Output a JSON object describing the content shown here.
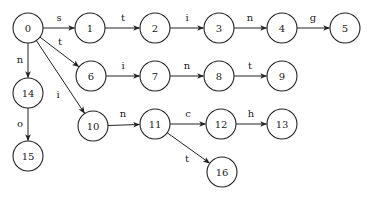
{
  "diagram": {
    "type": "trie",
    "node_radius": 15,
    "nodes": [
      {
        "id": "0",
        "x": 28,
        "y": 28
      },
      {
        "id": "1",
        "x": 90,
        "y": 28
      },
      {
        "id": "2",
        "x": 155,
        "y": 28
      },
      {
        "id": "3",
        "x": 219,
        "y": 28
      },
      {
        "id": "4",
        "x": 282,
        "y": 28
      },
      {
        "id": "5",
        "x": 345,
        "y": 28
      },
      {
        "id": "6",
        "x": 91,
        "y": 76
      },
      {
        "id": "7",
        "x": 155,
        "y": 76
      },
      {
        "id": "8",
        "x": 219,
        "y": 76
      },
      {
        "id": "9",
        "x": 282,
        "y": 76
      },
      {
        "id": "14",
        "x": 28,
        "y": 93
      },
      {
        "id": "15",
        "x": 28,
        "y": 156
      },
      {
        "id": "10",
        "x": 93,
        "y": 126
      },
      {
        "id": "11",
        "x": 155,
        "y": 124
      },
      {
        "id": "12",
        "x": 221,
        "y": 124
      },
      {
        "id": "13",
        "x": 282,
        "y": 124
      },
      {
        "id": "16",
        "x": 222,
        "y": 172
      }
    ],
    "edges": [
      {
        "from": "0",
        "to": "1",
        "label": "s",
        "lx": 59,
        "ly": 21
      },
      {
        "from": "1",
        "to": "2",
        "label": "t",
        "lx": 123,
        "ly": 21
      },
      {
        "from": "2",
        "to": "3",
        "label": "i",
        "lx": 187,
        "ly": 21
      },
      {
        "from": "3",
        "to": "4",
        "label": "n",
        "lx": 250,
        "ly": 21
      },
      {
        "from": "4",
        "to": "5",
        "label": "g",
        "lx": 313,
        "ly": 21
      },
      {
        "from": "0",
        "to": "6",
        "label": "t",
        "lx": 60,
        "ly": 45
      },
      {
        "from": "6",
        "to": "7",
        "label": "i",
        "lx": 123,
        "ly": 69
      },
      {
        "from": "7",
        "to": "8",
        "label": "n",
        "lx": 187,
        "ly": 69
      },
      {
        "from": "8",
        "to": "9",
        "label": "t",
        "lx": 250,
        "ly": 69
      },
      {
        "from": "0",
        "to": "14",
        "label": "n",
        "lx": 20,
        "ly": 63
      },
      {
        "from": "14",
        "to": "15",
        "label": "o",
        "lx": 20,
        "ly": 127
      },
      {
        "from": "0",
        "to": "10",
        "label": "i",
        "lx": 58,
        "ly": 98
      },
      {
        "from": "10",
        "to": "11",
        "label": "n",
        "lx": 123,
        "ly": 117
      },
      {
        "from": "11",
        "to": "12",
        "label": "c",
        "lx": 188,
        "ly": 117
      },
      {
        "from": "12",
        "to": "13",
        "label": "h",
        "lx": 251,
        "ly": 117
      },
      {
        "from": "11",
        "to": "16",
        "label": "t",
        "lx": 187,
        "ly": 162
      }
    ]
  }
}
